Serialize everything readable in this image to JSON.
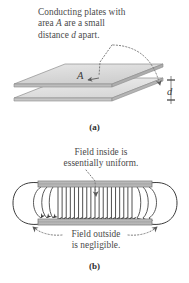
{
  "figure": {
    "background_color": "#ffffff",
    "ink_color": "#4a4a4a",
    "plate_fill": "#b9b9b9",
    "plate_edge": "#6e6e6e",
    "plate_face_light": "#e2e2e2",
    "plate_face_mid": "#d0d0d0",
    "field_line_color": "#3c3c3c",
    "leader_color": "#7a7a7a"
  },
  "panel_a": {
    "label": "(a)",
    "caption_line1": "Conducting plates with",
    "caption_line2_pre": "area ",
    "caption_line2_sym": "A",
    "caption_line2_post": " are a small",
    "caption_line3_pre": "distance ",
    "caption_line3_sym": "d",
    "caption_line3_post": " apart.",
    "area_label": "A",
    "gap_label": "d",
    "plate_count": 2
  },
  "panel_b": {
    "label": "(b)",
    "inside_label_line1": "Field inside is",
    "inside_label_line2": "essentially uniform.",
    "outside_label_line1": "Field outside",
    "outside_label_line2": "is negligible.",
    "uniform_field_line_count": 19,
    "field_direction": "downward",
    "fringe_loops": 2
  }
}
